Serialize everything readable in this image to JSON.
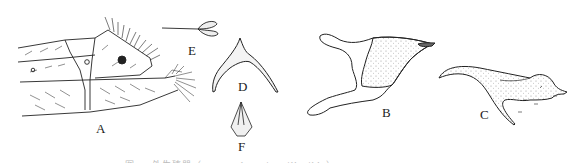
{
  "figure": {
    "panels": [
      {
        "id": "A",
        "label": "A",
        "description": "lateral view of abdominal apex with setae"
      },
      {
        "id": "B",
        "label": "B",
        "description": "genital structure, stippled"
      },
      {
        "id": "C",
        "label": "C",
        "description": "lateral view of genital structure with hooked process"
      },
      {
        "id": "D",
        "label": "D",
        "description": "arched Y-shaped sclerite"
      },
      {
        "id": "E",
        "label": "E",
        "description": "small bilobed structure on stalk"
      },
      {
        "id": "F",
        "label": "F",
        "description": "small triangular structure"
      }
    ],
    "caption": "图 — 外生殖器（truncated caption, illegible）",
    "colors": {
      "ink": "#222222",
      "stipple": "#888888",
      "background": "#ffffff"
    }
  }
}
